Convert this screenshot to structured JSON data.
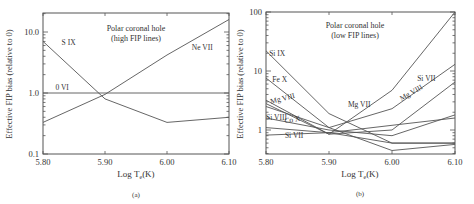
{
  "chart_data": [
    {
      "type": "line",
      "panel_label": "(a)",
      "title": "Polar coronal hole",
      "subtitle": "(high FIP lines)",
      "xlabel": "Log T_e(K)",
      "ylabel": "Effective FIP bias (relative to 0)",
      "yscale": "log",
      "xlim": [
        5.8,
        6.1
      ],
      "ylim": [
        0.1,
        20
      ],
      "x_ticks": [
        "5.80",
        "5.90",
        "6.00",
        "6.10"
      ],
      "y_ticks": [
        "0.1",
        "1.0",
        "10.0"
      ],
      "x": [
        5.8,
        5.9,
        6.0,
        6.1
      ],
      "series": [
        {
          "name": "S IX",
          "values": [
            7.0,
            0.8,
            0.33,
            0.4
          ],
          "label_pos": [
            5.83,
            6.2
          ]
        },
        {
          "name": "Ne VII",
          "values": [
            0.33,
            0.95,
            4.2,
            16
          ],
          "label_pos": [
            6.04,
            5.0
          ]
        },
        {
          "name": "0 VI",
          "values": [
            1.0,
            1.0,
            1.0,
            1.0
          ],
          "label_pos": [
            5.82,
            1.12
          ]
        }
      ]
    },
    {
      "type": "line",
      "panel_label": "(b)",
      "title": "Polar coronal hole",
      "subtitle": "(low FIP lines)",
      "xlabel": "Log T_e(K)",
      "ylabel": "Effective FIP bias (relative to 0)",
      "yscale": "log",
      "xlim": [
        5.8,
        6.1
      ],
      "ylim": [
        0.35,
        100
      ],
      "x_ticks": [
        "5.80",
        "5.90",
        "6.00",
        "6.10"
      ],
      "y_ticks": [
        "1",
        "10",
        "100"
      ],
      "x": [
        5.8,
        5.9,
        6.0,
        6.1
      ],
      "series": [
        {
          "name": "Si IX",
          "values": [
            22,
            1.9,
            0.6,
            0.6
          ],
          "label_pos": [
            5.805,
            18
          ]
        },
        {
          "name": "Fe X",
          "values": [
            7.6,
            1.1,
            0.45,
            0.57
          ],
          "label_pos": [
            5.81,
            6.4
          ]
        },
        {
          "name": "Mg VIII",
          "values": [
            3.2,
            0.85,
            1.0,
            6.5
          ],
          "label_pos": [
            5.808,
            2.75
          ],
          "label_rot": -15
        },
        {
          "name": "Mg VII",
          "values": [
            2.8,
            0.85,
            4.7,
            100
          ],
          "label_pos": [
            5.93,
            2.5
          ]
        },
        {
          "name": "Si VII",
          "values": [
            2.5,
            1.1,
            2.3,
            13
          ],
          "label_pos": [
            6.04,
            6.8
          ]
        },
        {
          "name": "Mg VIII",
          "values": [
            3.2,
            0.85,
            1.0,
            6.5
          ],
          "label_pos": [
            6.015,
            3.1
          ],
          "label_rot": -30,
          "label_only": true
        },
        {
          "name": "Si VIII",
          "values": [
            1.6,
            1.0,
            0.8,
            1.8
          ],
          "label_pos": [
            5.8,
            1.45
          ]
        },
        {
          "name": "Co X",
          "values": [
            1.1,
            0.9,
            1.2,
            1.6
          ],
          "label_pos": [
            5.83,
            1.3
          ],
          "label_rot": -10,
          "label_only_name": true
        },
        {
          "name": "Si VII",
          "values": [
            0.82,
            0.9,
            0.6,
            0.6
          ],
          "label_pos": [
            5.83,
            0.72
          ],
          "label_only_name": true
        }
      ]
    }
  ],
  "panels": {
    "a": {
      "label": "(a)",
      "title": "Polar coronal hole",
      "subtitle": "(high FIP lines)",
      "xlabel_main": "Log T",
      "xlabel_sub": "e",
      "xlabel_end": "(K)",
      "ylabel": "Effective FIP bias (relative to 0)"
    },
    "b": {
      "label": "(b)",
      "title": "Polar coronal hole",
      "subtitle": "(low FIP lines)",
      "xlabel_main": "Log T",
      "xlabel_sub": "e",
      "xlabel_end": "(K)",
      "ylabel": "Effective FIP bias (relative to 0)"
    }
  }
}
